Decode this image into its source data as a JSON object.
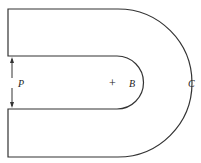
{
  "diagram": {
    "labels": {
      "p": "P",
      "b": "B",
      "c": "C",
      "center_mark": "+"
    },
    "colors": {
      "stroke": "#333333",
      "text": "#222222",
      "background": "#ffffff"
    }
  }
}
